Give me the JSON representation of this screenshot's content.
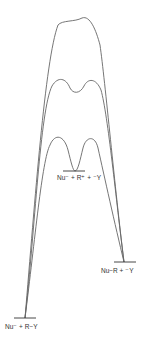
{
  "diagram": {
    "type": "reaction-energy-profile",
    "curves": [
      {
        "name": "outer-curve",
        "description": "single broad high-energy barrier"
      },
      {
        "name": "middle-curve",
        "description": "two peaks with shallow dip"
      },
      {
        "name": "inner-curve",
        "description": "two peaks with intermediate minimum"
      }
    ],
    "levels": {
      "reactants": {
        "label": "Nu⁻ + R−Y"
      },
      "intermediate": {
        "label": "Nu⁻ + R⁺ + ⁻Y"
      },
      "products": {
        "label": "Nu−R + ⁻Y"
      }
    },
    "colors": {
      "curve": "#666666",
      "level_line": "#333333",
      "text": "#333333"
    }
  }
}
